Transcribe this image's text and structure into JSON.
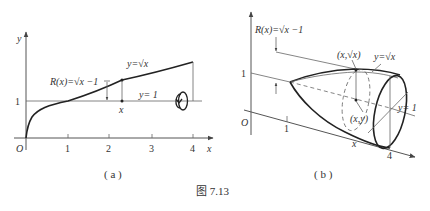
{
  "figure_caption": "图 7.13",
  "panel_a": {
    "label": "( a )",
    "axis_x_label": "x",
    "axis_y_label": "y",
    "origin_label": "O",
    "x_ticks": [
      "1",
      "2",
      "3",
      "4"
    ],
    "y_tick": "1",
    "curve_label": "y=√x",
    "line_label": "y= 1",
    "radius_label": "R(x)=√x −1",
    "point_label": "x",
    "rotation_icon": "rotate-about-line-icon"
  },
  "panel_b": {
    "label": "( b )",
    "origin_label": "O",
    "y_tick": "1",
    "x_tick_1": "1",
    "x_tick_4": "4",
    "radius_label": "R(x)=√x −1",
    "curve_label": "y=√x",
    "top_point_label": "(x,√x)",
    "inner_point_label": "(x,y)",
    "line_label": "y= 1",
    "point_label": "x"
  }
}
